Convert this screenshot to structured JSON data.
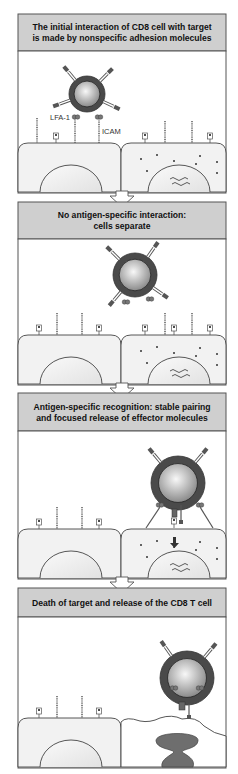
{
  "panels": [
    {
      "id": "initial-adhesion",
      "header_lines": [
        "The initial interaction of CD8 cell with target",
        "is made by nonspecific adhesion molecules"
      ],
      "labels": {
        "lfa1": "LFA-1",
        "icam": "ICAM"
      },
      "tcell_state": "adhered",
      "target_state": "intact"
    },
    {
      "id": "no-antigen-separate",
      "header_lines": [
        "No antigen-specific interaction:",
        "cells separate"
      ],
      "tcell_state": "detached",
      "target_state": "intact"
    },
    {
      "id": "antigen-recognition",
      "header_lines": [
        "Antigen-specific recognition: stable pairing",
        "and focused release of effector molecules"
      ],
      "tcell_state": "paired",
      "target_state": "intact"
    },
    {
      "id": "target-death",
      "header_lines": [
        "Death of target and release of the CD8 T cell"
      ],
      "tcell_state": "released",
      "target_state": "dead"
    }
  ],
  "colors": {
    "header_bg": "#cfcfcf",
    "border": "#555555",
    "cell_fill": "#f2f2f2",
    "tcell_outer": "#4a4a4a",
    "tcell_inner_light": "#f4f4f4",
    "tcell_inner_dark": "#8a8a8a",
    "dead_nucleus": "#6e6e6e",
    "arrow_fill": "#ffffff"
  }
}
